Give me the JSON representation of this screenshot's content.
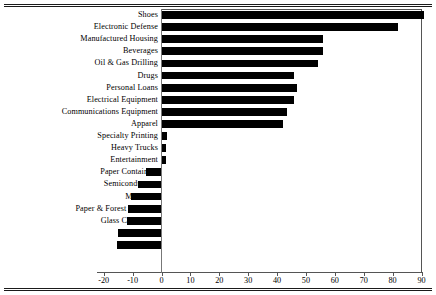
{
  "chart_data": {
    "type": "bar",
    "orientation": "horizontal",
    "title": "",
    "subtitle": "",
    "xlabel": "",
    "ylabel": "",
    "xlim": [
      -20,
      90
    ],
    "xticks": [
      -20,
      -10,
      0,
      10,
      20,
      30,
      40,
      50,
      60,
      70,
      80,
      90
    ],
    "xtick_labels": [
      "-20",
      "-10",
      "0",
      "10",
      "20",
      "30",
      "40",
      "50",
      "60",
      "70",
      "80",
      "90"
    ],
    "grid": false,
    "legend": null,
    "bar_color": "#000000",
    "categories": [
      "Shoes",
      "Electronic Defense",
      "Manufactured Housing",
      "Beverages",
      "Oil & Gas Drilling",
      "Drugs",
      "Personal Loans",
      "Electrical Equipment",
      "Communications Equipment",
      "Apparel",
      "Specialty Printing",
      "Heavy Trucks",
      "Entertainment",
      "Paper Containers",
      "Semiconductors",
      "Machines",
      "Paper & Forest Products",
      "Glass Containers",
      "Steel",
      "Truckers"
    ],
    "values": [
      91,
      82,
      56,
      56,
      54,
      46,
      47,
      46,
      43.5,
      42,
      2,
      1.5,
      1.5,
      -5.5,
      -8,
      -10.5,
      -11.5,
      -12,
      -15,
      -15.5
    ]
  }
}
